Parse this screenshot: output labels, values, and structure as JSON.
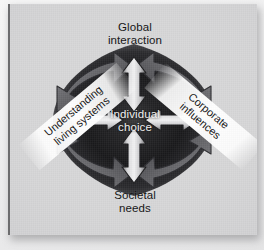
{
  "figure": {
    "background_color": "#d6d6d7",
    "core_color": "#141415",
    "label_color_outer": "#111112",
    "label_color_center": "#f2f2f2"
  },
  "diagram": {
    "type": "radial-influence",
    "center": {
      "id": "individual-choice",
      "label": "Individual\nchoice"
    },
    "nodes": [
      {
        "id": "global-interaction",
        "label": "Global\ninteraction",
        "position": "top",
        "style": "plain"
      },
      {
        "id": "corporate-influences",
        "label": "Corporate\ninfluences",
        "position": "right",
        "style": "banner",
        "rotation_deg": 40
      },
      {
        "id": "societal-needs",
        "label": "Societal\nneeds",
        "position": "bottom",
        "style": "plain"
      },
      {
        "id": "understanding-living-systems",
        "label": "Understanding\nliving systems",
        "position": "left",
        "style": "banner",
        "rotation_deg": -40
      }
    ],
    "connectors": [
      {
        "id": "center-top",
        "from": "individual-choice",
        "to": "global-interaction",
        "shape": "straight",
        "heads": "both"
      },
      {
        "id": "center-bottom",
        "from": "individual-choice",
        "to": "societal-needs",
        "shape": "straight",
        "heads": "both"
      },
      {
        "id": "center-left",
        "from": "individual-choice",
        "to": "understanding-living-systems",
        "shape": "straight",
        "heads": "both"
      },
      {
        "id": "center-right",
        "from": "individual-choice",
        "to": "corporate-influences",
        "shape": "straight",
        "heads": "both"
      },
      {
        "id": "top-left-curve",
        "from": "global-interaction",
        "to": "understanding-living-systems",
        "shape": "curved",
        "heads": "both"
      },
      {
        "id": "top-right-curve",
        "from": "global-interaction",
        "to": "corporate-influences",
        "shape": "curved",
        "heads": "both"
      },
      {
        "id": "bottom-left-curve",
        "from": "societal-needs",
        "to": "understanding-living-systems",
        "shape": "curved",
        "heads": "both"
      },
      {
        "id": "bottom-right-curve",
        "from": "societal-needs",
        "to": "corporate-influences",
        "shape": "curved",
        "heads": "both"
      }
    ]
  }
}
